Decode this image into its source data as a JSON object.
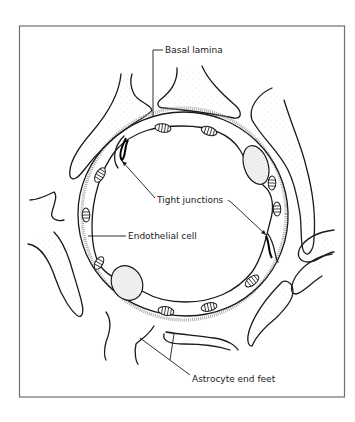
{
  "figure": {
    "frame_color": "#6f6f6f",
    "ink_color": "#1a1a1a",
    "labels": {
      "basal_lamina": "Basal lamina",
      "tight_junctions": "Tight junctions",
      "endothelial_cell": "Endothelial cell",
      "astrocyte_end_feet": "Astrocyte end feet"
    },
    "structures": [
      "capillary-lumen",
      "endothelial-cell-layer",
      "basal-lamina",
      "astrocyte-end-feet",
      "endothelial-nuclei",
      "mitochondria",
      "tight-junctions"
    ]
  }
}
